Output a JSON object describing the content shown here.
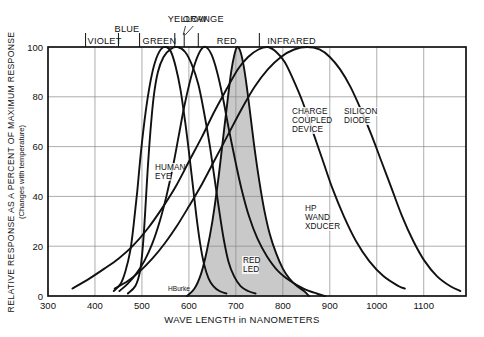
{
  "chart_data": {
    "type": "line",
    "title": "",
    "xlabel": "WAVE LENGTH in NANOMETERS",
    "ylabel": "RELATIVE RESPONSE AS A PERCENT OF MAXIMUM RESPONSE",
    "ylabel_sub": "(Changes with temperature)",
    "xlim": [
      300,
      1190
    ],
    "ylim": [
      0,
      100
    ],
    "xticks": [
      300,
      400,
      500,
      600,
      700,
      800,
      900,
      1000,
      1100
    ],
    "yticks": [
      0,
      20,
      40,
      60,
      80,
      100
    ],
    "grid": true,
    "legend": "inline-annotations",
    "signature": "HBurke",
    "spectrum_bands": [
      {
        "label": "VIOLET",
        "start": 380,
        "end": 450
      },
      {
        "label": "BLUE",
        "start": 450,
        "end": 495
      },
      {
        "label": "GREEN",
        "start": 495,
        "end": 570
      },
      {
        "label": "YELLOW",
        "start": 570,
        "end": 590
      },
      {
        "label": "ORANGE",
        "start": 590,
        "end": 620
      },
      {
        "label": "RED",
        "start": 620,
        "end": 750
      },
      {
        "label": "INFRARED",
        "start": 750,
        "end": 1190
      }
    ],
    "series": [
      {
        "name": "HUMAN EYE",
        "label": "HUMAN\nEYE",
        "filled": false,
        "points": [
          [
            440,
            2
          ],
          [
            455,
            5
          ],
          [
            465,
            10
          ],
          [
            475,
            18
          ],
          [
            482,
            28
          ],
          [
            490,
            42
          ],
          [
            498,
            58
          ],
          [
            508,
            74
          ],
          [
            518,
            86
          ],
          [
            528,
            94
          ],
          [
            540,
            99
          ],
          [
            552,
            100
          ],
          [
            562,
            98
          ],
          [
            572,
            92
          ],
          [
            582,
            83
          ],
          [
            592,
            70
          ],
          [
            600,
            58
          ],
          [
            608,
            45
          ],
          [
            616,
            32
          ],
          [
            624,
            21
          ],
          [
            632,
            13
          ],
          [
            642,
            7
          ],
          [
            652,
            4
          ],
          [
            665,
            2
          ],
          [
            680,
            1
          ]
        ]
      },
      {
        "name": "RED LED",
        "label": "RED\nLED",
        "filled": true,
        "points": [
          [
            596,
            0
          ],
          [
            612,
            3
          ],
          [
            626,
            9
          ],
          [
            638,
            18
          ],
          [
            650,
            30
          ],
          [
            662,
            46
          ],
          [
            672,
            62
          ],
          [
            682,
            78
          ],
          [
            690,
            90
          ],
          [
            697,
            97
          ],
          [
            703,
            100
          ],
          [
            710,
            98
          ],
          [
            717,
            92
          ],
          [
            724,
            83
          ],
          [
            732,
            71
          ],
          [
            740,
            59
          ],
          [
            750,
            46
          ],
          [
            760,
            35
          ],
          [
            772,
            25
          ],
          [
            786,
            17
          ],
          [
            800,
            11
          ],
          [
            814,
            7
          ],
          [
            830,
            4
          ],
          [
            845,
            2
          ],
          [
            856,
            0
          ]
        ]
      },
      {
        "name": "HP WAND XDUCER",
        "label": "HP\nWAND\nXDUCER",
        "filled": false,
        "points": [
          [
            452,
            2
          ],
          [
            470,
            5
          ],
          [
            488,
            9
          ],
          [
            505,
            14
          ],
          [
            522,
            21
          ],
          [
            538,
            30
          ],
          [
            552,
            40
          ],
          [
            566,
            52
          ],
          [
            578,
            64
          ],
          [
            590,
            76
          ],
          [
            602,
            86
          ],
          [
            614,
            94
          ],
          [
            626,
            99
          ],
          [
            636,
            100
          ],
          [
            648,
            97
          ],
          [
            660,
            90
          ],
          [
            672,
            80
          ],
          [
            684,
            68
          ],
          [
            698,
            55
          ],
          [
            712,
            43
          ],
          [
            728,
            32
          ],
          [
            746,
            23
          ],
          [
            766,
            16
          ],
          [
            790,
            10
          ],
          [
            816,
            6
          ],
          [
            844,
            3
          ],
          [
            872,
            1
          ],
          [
            890,
            0
          ]
        ]
      },
      {
        "name": "CHARGE COUPLED DEVICE",
        "label": "CHARGE\nCOUPLED\nDEVICE",
        "filled": false,
        "points": [
          [
            352,
            3
          ],
          [
            388,
            7
          ],
          [
            420,
            11
          ],
          [
            450,
            15
          ],
          [
            480,
            20
          ],
          [
            512,
            27
          ],
          [
            542,
            35
          ],
          [
            572,
            44
          ],
          [
            600,
            54
          ],
          [
            628,
            64
          ],
          [
            654,
            74
          ],
          [
            680,
            83
          ],
          [
            704,
            91
          ],
          [
            726,
            96
          ],
          [
            748,
            99
          ],
          [
            768,
            100
          ],
          [
            786,
            98
          ],
          [
            804,
            94
          ],
          [
            822,
            87
          ],
          [
            842,
            78
          ],
          [
            862,
            67
          ],
          [
            884,
            55
          ],
          [
            906,
            43
          ],
          [
            930,
            32
          ],
          [
            956,
            22
          ],
          [
            984,
            14
          ],
          [
            1014,
            8
          ],
          [
            1046,
            4
          ],
          [
            1060,
            3
          ]
        ]
      },
      {
        "name": "SILICON DIODE",
        "label": "SILICON\nDIODE",
        "filled": false,
        "points": [
          [
            442,
            3
          ],
          [
            470,
            6
          ],
          [
            496,
            10
          ],
          [
            522,
            15
          ],
          [
            548,
            21
          ],
          [
            574,
            28
          ],
          [
            600,
            36
          ],
          [
            628,
            45
          ],
          [
            656,
            55
          ],
          [
            684,
            65
          ],
          [
            712,
            75
          ],
          [
            740,
            84
          ],
          [
            768,
            91
          ],
          [
            796,
            96
          ],
          [
            824,
            99
          ],
          [
            852,
            100
          ],
          [
            878,
            99
          ],
          [
            900,
            96
          ],
          [
            922,
            91
          ],
          [
            944,
            84
          ],
          [
            966,
            75
          ],
          [
            988,
            65
          ],
          [
            1010,
            54
          ],
          [
            1032,
            43
          ],
          [
            1054,
            32
          ],
          [
            1078,
            22
          ],
          [
            1102,
            14
          ],
          [
            1128,
            8
          ],
          [
            1156,
            4
          ],
          [
            1178,
            2
          ]
        ]
      },
      {
        "name": "UNLABELED BLUE RESPONSE",
        "label": "",
        "filled": false,
        "points": [
          [
            470,
            1
          ],
          [
            486,
            4
          ],
          [
            496,
            10
          ],
          [
            502,
            20
          ],
          [
            507,
            34
          ],
          [
            512,
            50
          ],
          [
            518,
            66
          ],
          [
            525,
            80
          ],
          [
            534,
            90
          ],
          [
            546,
            96
          ],
          [
            560,
            99
          ],
          [
            576,
            100
          ],
          [
            592,
            98
          ],
          [
            606,
            93
          ],
          [
            620,
            85
          ],
          [
            632,
            74
          ],
          [
            644,
            61
          ],
          [
            654,
            48
          ],
          [
            664,
            35
          ],
          [
            674,
            23
          ],
          [
            684,
            14
          ],
          [
            696,
            8
          ],
          [
            710,
            4
          ],
          [
            726,
            2
          ],
          [
            742,
            1
          ]
        ]
      }
    ],
    "curve_annotations": [
      {
        "name": "HUMAN EYE",
        "lines": [
          "HUMAN",
          "EYE"
        ],
        "x_px": 155,
        "y_px": 170
      },
      {
        "name": "RED LED",
        "lines": [
          "RED",
          "LED"
        ],
        "x_px": 243,
        "y_px": 263
      },
      {
        "name": "HP WAND XDUCER",
        "lines": [
          "HP",
          "WAND",
          "XDUCER"
        ],
        "x_px": 305,
        "y_px": 211
      },
      {
        "name": "CHARGE COUPLED DEVICE",
        "lines": [
          "CHARGE",
          "COUPLED",
          "DEVICE"
        ],
        "x_px": 292,
        "y_px": 114
      },
      {
        "name": "SILICON DIODE",
        "lines": [
          "SILICON",
          "DIODE"
        ],
        "x_px": 344,
        "y_px": 114
      }
    ]
  },
  "colors": {
    "background": "#ffffff",
    "ink": "#111111",
    "grid": "#8a8a8a",
    "shaded_fill": "#c9c9c9"
  }
}
